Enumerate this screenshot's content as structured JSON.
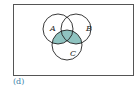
{
  "diagram": {
    "type": "venn",
    "sets": [
      {
        "id": "A",
        "label": "A"
      },
      {
        "id": "B",
        "label": "B"
      },
      {
        "id": "C",
        "label": "C"
      }
    ],
    "shaded_region": "(A ∪ B) ∩ C",
    "shade_color": "#8fc3c0",
    "outline_color": "#222222",
    "frame_color": "#555555"
  },
  "caption": "(d)"
}
